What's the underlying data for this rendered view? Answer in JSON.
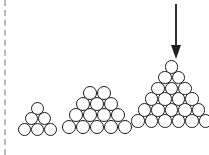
{
  "figure": {
    "title": "",
    "background_color": "#ffffff",
    "stroke_color": "#1b1b1b",
    "divider_color": "#b9b9b9",
    "arrow_color": "#1f1f1f",
    "width": 209,
    "height": 155
  },
  "left_divider": {
    "style": "dashed",
    "orientation": "vertical"
  },
  "arrow": {
    "direction": "down",
    "points_to": "largest-sphere-stack",
    "label": ""
  },
  "chart_data": {
    "type": "diagram",
    "title": "",
    "xlabel": "",
    "ylabel": "",
    "categories": [
      "small-stack",
      "medium-stack",
      "large-stack"
    ],
    "values": [
      6,
      14,
      21
    ],
    "series": [
      {
        "name": "rows_per_stack",
        "values": [
          3,
          4,
          6
        ]
      },
      {
        "name": "visible_spheres",
        "values": [
          6,
          14,
          21
        ]
      }
    ],
    "stacks": [
      {
        "name": "small-stack",
        "rows": [
          1,
          2,
          3
        ],
        "total_spheres": 6,
        "ball_diameter_px": 13,
        "origin": {
          "x": 18,
          "y": 102
        }
      },
      {
        "name": "medium-stack",
        "rows": [
          2,
          3,
          4,
          5
        ],
        "total_spheres": 14,
        "ball_diameter_px": 14,
        "origin": {
          "x": 62,
          "y": 86
        }
      },
      {
        "name": "large-stack",
        "rows": [
          1,
          2,
          3,
          4,
          5,
          6
        ],
        "total_spheres": 21,
        "ball_diameter_px": 13.5,
        "origin": {
          "x": 131,
          "y": 60
        }
      }
    ],
    "annotations": [
      {
        "type": "arrow",
        "direction": "down",
        "target": "large-stack"
      },
      {
        "type": "divider",
        "style": "dashed",
        "position": "left-edge"
      }
    ]
  }
}
